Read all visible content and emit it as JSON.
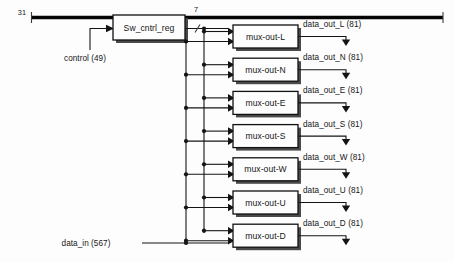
{
  "diagram": {
    "colors": {
      "background": "#fdfdfd",
      "line": "#141414",
      "bus_thick": "#050505",
      "box_fill": "#fdfdfd",
      "box_stroke": "#111111",
      "box_shadow": "#4a4a4a",
      "text": "#161616"
    },
    "top_bus": {
      "label": "31",
      "x_start": 30,
      "x_end": 443,
      "y": 17
    },
    "register": {
      "label": "Sw_cntrl_reg",
      "x": 113,
      "y": 15,
      "width": 72,
      "height": 25
    },
    "control_input": {
      "label": "control (49)",
      "x": 85,
      "y": 58
    },
    "bus_width_label": {
      "label": "7",
      "x": 194,
      "y": 12
    },
    "data_input": {
      "label": "data_in (567)",
      "x": 86,
      "y": 246
    },
    "mux_geometry": {
      "x": 233,
      "width": 65,
      "height": 23,
      "y_first": 25,
      "y_spacing": 33.2
    },
    "bus_lines": {
      "control_bus_x": 186,
      "data_bus_x": 204,
      "control_bus_y_top": 40,
      "control_bus_y_bottom": 243,
      "data_bus_y_top": 28,
      "data_bus_y_bottom": 233
    },
    "muxes": [
      {
        "label": "mux-out-L",
        "output_label": "data_out_L (81)",
        "output_width": "81"
      },
      {
        "label": "mux-out-N",
        "output_label": "data_out_N (81)",
        "output_width": "81"
      },
      {
        "label": "mux-out-E",
        "output_label": "data_out_E (81)",
        "output_width": "81"
      },
      {
        "label": "mux-out-S",
        "output_label": "data_out_S (81)",
        "output_width": "81"
      },
      {
        "label": "mux-out-W",
        "output_label": "data_out_W (81)",
        "output_width": "81"
      },
      {
        "label": "mux-out-U",
        "output_label": "data_out_U (81)",
        "output_width": "81"
      },
      {
        "label": "mux-out-D",
        "output_label": "data_out_D (81)",
        "output_width": "81"
      }
    ]
  }
}
